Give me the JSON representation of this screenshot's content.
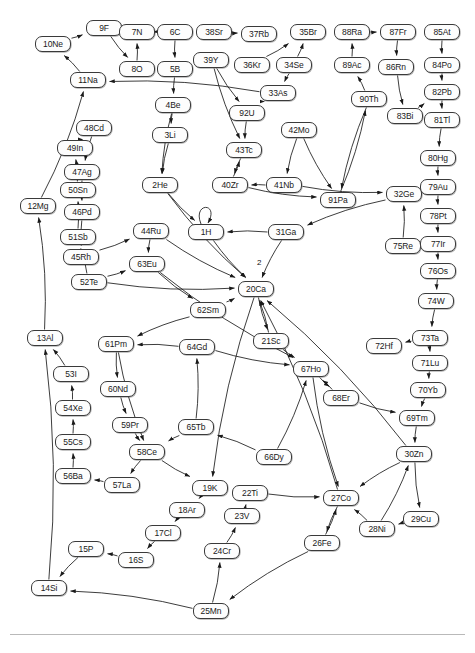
{
  "figure": {
    "type": "directed-graph",
    "node_shape": "rounded-rectangle",
    "node_width": 36,
    "node_height": 16,
    "colors": {
      "node_fill": "#fdfdfd",
      "node_border": "#3a3a3a",
      "edge": "#1a1a1a",
      "text": "#1a1a1a",
      "rule": "#b9b9b9",
      "background": "#ffffff"
    },
    "nodes": [
      {
        "id": "10Ne",
        "label": "10Ne",
        "x": 35,
        "y": 36
      },
      {
        "id": "9F",
        "label": "9F",
        "x": 86,
        "y": 20
      },
      {
        "id": "7N",
        "label": "7N",
        "x": 119,
        "y": 24
      },
      {
        "id": "6C",
        "label": "6C",
        "x": 157,
        "y": 24
      },
      {
        "id": "38Sr",
        "label": "38Sr",
        "x": 196,
        "y": 24
      },
      {
        "id": "37Rb",
        "label": "37Rb",
        "x": 241,
        "y": 26
      },
      {
        "id": "35Br",
        "label": "35Br",
        "x": 290,
        "y": 24
      },
      {
        "id": "88Ra",
        "label": "88Ra",
        "x": 334,
        "y": 24
      },
      {
        "id": "87Fr",
        "label": "87Fr",
        "x": 380,
        "y": 24
      },
      {
        "id": "85At",
        "label": "85At",
        "x": 424,
        "y": 24
      },
      {
        "id": "8O",
        "label": "8O",
        "x": 119,
        "y": 61
      },
      {
        "id": "5B",
        "label": "5B",
        "x": 157,
        "y": 61
      },
      {
        "id": "39Y",
        "label": "39Y",
        "x": 193,
        "y": 52
      },
      {
        "id": "36Kr",
        "label": "36Kr",
        "x": 234,
        "y": 57
      },
      {
        "id": "34Se",
        "label": "34Se",
        "x": 276,
        "y": 57
      },
      {
        "id": "89Ac",
        "label": "89Ac",
        "x": 334,
        "y": 57
      },
      {
        "id": "86Rn",
        "label": "86Rn",
        "x": 378,
        "y": 59
      },
      {
        "id": "84Po",
        "label": "84Po",
        "x": 424,
        "y": 57
      },
      {
        "id": "11Na",
        "label": "11Na",
        "x": 70,
        "y": 72
      },
      {
        "id": "33As",
        "label": "33As",
        "x": 260,
        "y": 85
      },
      {
        "id": "90Th",
        "label": "90Th",
        "x": 351,
        "y": 91
      },
      {
        "id": "82Pb",
        "label": "82Pb",
        "x": 424,
        "y": 84
      },
      {
        "id": "4Be",
        "label": "4Be",
        "x": 155,
        "y": 97
      },
      {
        "id": "92U",
        "label": "92U",
        "x": 229,
        "y": 105
      },
      {
        "id": "63Bi",
        "label": "83Bi",
        "x": 387,
        "y": 108
      },
      {
        "id": "81Tl",
        "label": "81Tl",
        "x": 424,
        "y": 112
      },
      {
        "id": "3Li",
        "label": "3Li",
        "x": 152,
        "y": 127
      },
      {
        "id": "42Mo",
        "label": "42Mo",
        "x": 281,
        "y": 122
      },
      {
        "id": "48Cd",
        "label": "48Cd",
        "x": 76,
        "y": 120
      },
      {
        "id": "43Tc",
        "label": "43Tc",
        "x": 226,
        "y": 142
      },
      {
        "id": "80Hg",
        "label": "80Hg",
        "x": 420,
        "y": 150
      },
      {
        "id": "49In",
        "label": "49In",
        "x": 57,
        "y": 140
      },
      {
        "id": "47Ag",
        "label": "47Ag",
        "x": 64,
        "y": 164
      },
      {
        "id": "50Sn",
        "label": "50Sn",
        "x": 60,
        "y": 182
      },
      {
        "id": "2He",
        "label": "2He",
        "x": 142,
        "y": 177
      },
      {
        "id": "40Zr",
        "label": "40Zr",
        "x": 212,
        "y": 177
      },
      {
        "id": "41Nb",
        "label": "41Nb",
        "x": 266,
        "y": 177
      },
      {
        "id": "91Pa",
        "label": "91Pa",
        "x": 320,
        "y": 192
      },
      {
        "id": "32Ge",
        "label": "32Ge",
        "x": 386,
        "y": 186
      },
      {
        "id": "79Au",
        "label": "79Au",
        "x": 420,
        "y": 179
      },
      {
        "id": "46Pd",
        "label": "46Pd",
        "x": 64,
        "y": 204
      },
      {
        "id": "78Pt",
        "label": "78Pt",
        "x": 420,
        "y": 208
      },
      {
        "id": "44Ru",
        "label": "44Ru",
        "x": 133,
        "y": 223
      },
      {
        "id": "1H",
        "label": "1H",
        "x": 188,
        "y": 224
      },
      {
        "id": "31Ga",
        "label": "31Ga",
        "x": 268,
        "y": 224
      },
      {
        "id": "51Sb",
        "label": "51Sb",
        "x": 60,
        "y": 229
      },
      {
        "id": "75Re",
        "label": "75Re",
        "x": 385,
        "y": 238
      },
      {
        "id": "77Ir",
        "label": "77Ir",
        "x": 420,
        "y": 236
      },
      {
        "id": "45Rh",
        "label": "45Rh",
        "x": 63,
        "y": 249
      },
      {
        "id": "63Eu",
        "label": "63Eu",
        "x": 129,
        "y": 256
      },
      {
        "id": "76Os",
        "label": "76Os",
        "x": 420,
        "y": 263
      },
      {
        "id": "52Te",
        "label": "52Te",
        "x": 71,
        "y": 274
      },
      {
        "id": "20Ca",
        "label": "20Ca",
        "x": 238,
        "y": 281
      },
      {
        "id": "74W",
        "label": "74W",
        "x": 418,
        "y": 293
      },
      {
        "id": "12Mg",
        "label": "12Mg",
        "x": 20,
        "y": 198
      },
      {
        "id": "62Sm",
        "label": "62Sm",
        "x": 190,
        "y": 302
      },
      {
        "id": "21Sc",
        "label": "21Sc",
        "x": 253,
        "y": 333
      },
      {
        "id": "72Hf",
        "label": "72Hf",
        "x": 366,
        "y": 338
      },
      {
        "id": "73Ta",
        "label": "73Ta",
        "x": 412,
        "y": 330
      },
      {
        "id": "13Al",
        "label": "13Al",
        "x": 27,
        "y": 330
      },
      {
        "id": "61Pm",
        "label": "61Pm",
        "x": 98,
        "y": 336
      },
      {
        "id": "64Gd",
        "label": "64Gd",
        "x": 179,
        "y": 339
      },
      {
        "id": "67Ho",
        "label": "67Ho",
        "x": 293,
        "y": 361
      },
      {
        "id": "71Lu",
        "label": "71Lu",
        "x": 412,
        "y": 355
      },
      {
        "id": "53I",
        "label": "53I",
        "x": 53,
        "y": 366
      },
      {
        "id": "60Nd",
        "label": "60Nd",
        "x": 100,
        "y": 381
      },
      {
        "id": "68Er",
        "label": "68Er",
        "x": 323,
        "y": 390
      },
      {
        "id": "70Yb",
        "label": "70Yb",
        "x": 410,
        "y": 382
      },
      {
        "id": "54Xe",
        "label": "54Xe",
        "x": 55,
        "y": 400
      },
      {
        "id": "59Pr",
        "label": "59Pr",
        "x": 112,
        "y": 417
      },
      {
        "id": "69Tm",
        "label": "69Tm",
        "x": 399,
        "y": 410
      },
      {
        "id": "65Tb",
        "label": "65Tb",
        "x": 178,
        "y": 419
      },
      {
        "id": "55Cs",
        "label": "55Cs",
        "x": 55,
        "y": 434
      },
      {
        "id": "58Ce",
        "label": "58Ce",
        "x": 129,
        "y": 444
      },
      {
        "id": "66Dy",
        "label": "66Dy",
        "x": 256,
        "y": 449
      },
      {
        "id": "30Zn",
        "label": "30Zn",
        "x": 396,
        "y": 446
      },
      {
        "id": "56Ba",
        "label": "56Ba",
        "x": 55,
        "y": 468
      },
      {
        "id": "57La",
        "label": "57La",
        "x": 104,
        "y": 477
      },
      {
        "id": "19K",
        "label": "19K",
        "x": 192,
        "y": 480
      },
      {
        "id": "22Ti",
        "label": "22Ti",
        "x": 232,
        "y": 485
      },
      {
        "id": "27Co",
        "label": "27Co",
        "x": 323,
        "y": 490
      },
      {
        "id": "29Cu",
        "label": "29Cu",
        "x": 403,
        "y": 511
      },
      {
        "id": "18Ar",
        "label": "18Ar",
        "x": 169,
        "y": 502
      },
      {
        "id": "23V",
        "label": "23V",
        "x": 224,
        "y": 508
      },
      {
        "id": "28Ni",
        "label": "28Ni",
        "x": 359,
        "y": 521
      },
      {
        "id": "17Cl",
        "label": "17Cl",
        "x": 145,
        "y": 525
      },
      {
        "id": "15P",
        "label": "15P",
        "x": 68,
        "y": 541
      },
      {
        "id": "16S",
        "label": "16S",
        "x": 118,
        "y": 552
      },
      {
        "id": "24Cr",
        "label": "24Cr",
        "x": 204,
        "y": 543
      },
      {
        "id": "26Fe",
        "label": "26Fe",
        "x": 304,
        "y": 535
      },
      {
        "id": "14Si",
        "label": "14Si",
        "x": 31,
        "y": 580
      },
      {
        "id": "25Mn",
        "label": "25Mn",
        "x": 193,
        "y": 603
      }
    ],
    "edges": [
      {
        "from": "10Ne",
        "to": "9F"
      },
      {
        "from": "9F",
        "to": "8O"
      },
      {
        "from": "7N",
        "to": "6C"
      },
      {
        "from": "8O",
        "to": "7N"
      },
      {
        "from": "6C",
        "to": "5B"
      },
      {
        "from": "5B",
        "to": "4Be"
      },
      {
        "from": "4Be",
        "to": "3Li"
      },
      {
        "from": "11Na",
        "to": "10Ne"
      },
      {
        "from": "38Sr",
        "to": "37Rb"
      },
      {
        "from": "36Kr",
        "to": "35Br"
      },
      {
        "from": "34Se",
        "to": "35Br"
      },
      {
        "from": "34Se",
        "to": "33As"
      },
      {
        "from": "33As",
        "to": "11Na"
      },
      {
        "from": "33As",
        "to": "92U"
      },
      {
        "from": "88Ra",
        "to": "87Fr"
      },
      {
        "from": "89Ac",
        "to": "88Ra"
      },
      {
        "from": "90Th",
        "to": "89Ac"
      },
      {
        "from": "87Fr",
        "to": "86Rn"
      },
      {
        "from": "85At",
        "to": "84Po"
      },
      {
        "from": "84Po",
        "to": "82Pb"
      },
      {
        "from": "86Rn",
        "to": "63Bi"
      },
      {
        "from": "63Bi",
        "to": "82Pb"
      },
      {
        "from": "82Pb",
        "to": "81Tl"
      },
      {
        "from": "81Tl",
        "to": "80Hg"
      },
      {
        "from": "80Hg",
        "to": "79Au"
      },
      {
        "from": "79Au",
        "to": "78Pt"
      },
      {
        "from": "78Pt",
        "to": "77Ir"
      },
      {
        "from": "77Ir",
        "to": "76Os"
      },
      {
        "from": "76Os",
        "to": "74W"
      },
      {
        "from": "74W",
        "to": "73Ta"
      },
      {
        "from": "73Ta",
        "to": "72Hf"
      },
      {
        "from": "73Ta",
        "to": "71Lu"
      },
      {
        "from": "71Lu",
        "to": "70Yb"
      },
      {
        "from": "70Yb",
        "to": "69Tm"
      },
      {
        "from": "69Tm",
        "to": "30Zn"
      },
      {
        "from": "48Cd",
        "to": "47Ag"
      },
      {
        "from": "49In",
        "to": "48Cd"
      },
      {
        "from": "47Ag",
        "to": "46Pd"
      },
      {
        "from": "50Sn",
        "to": "49In"
      },
      {
        "from": "46Pd",
        "to": "45Rh"
      },
      {
        "from": "51Sb",
        "to": "50Sn"
      },
      {
        "from": "45Rh",
        "to": "44Ru"
      },
      {
        "from": "52Te",
        "to": "51Sb"
      },
      {
        "from": "52Te",
        "to": "63Eu"
      },
      {
        "from": "44Ru",
        "to": "63Eu"
      },
      {
        "from": "41Nb",
        "to": "40Zr"
      },
      {
        "from": "42Mo",
        "to": "41Nb"
      },
      {
        "from": "40Zr",
        "to": "43Tc"
      },
      {
        "from": "2He",
        "to": "1H"
      },
      {
        "from": "1H",
        "to": "1H",
        "self": true
      },
      {
        "from": "31Ga",
        "to": "1H"
      },
      {
        "from": "31Ga",
        "to": "20Ca",
        "label": "2"
      },
      {
        "from": "75Re",
        "to": "32Ge"
      },
      {
        "from": "52Te",
        "to": "20Ca"
      },
      {
        "from": "62Sm",
        "to": "61Pm"
      },
      {
        "from": "60Nd",
        "to": "59Pr"
      },
      {
        "from": "59Pr",
        "to": "58Ce"
      },
      {
        "from": "61Pm",
        "to": "60Nd"
      },
      {
        "from": "53I",
        "to": "13Al"
      },
      {
        "from": "54Xe",
        "to": "53I"
      },
      {
        "from": "55Cs",
        "to": "54Xe"
      },
      {
        "from": "56Ba",
        "to": "55Cs"
      },
      {
        "from": "57La",
        "to": "56Ba"
      },
      {
        "from": "58Ce",
        "to": "57La"
      },
      {
        "from": "19K",
        "to": "18Ar"
      },
      {
        "from": "18Ar",
        "to": "17Cl"
      },
      {
        "from": "17Cl",
        "to": "16S"
      },
      {
        "from": "16S",
        "to": "15P"
      },
      {
        "from": "15P",
        "to": "14Si"
      },
      {
        "from": "25Mn",
        "to": "24Cr"
      },
      {
        "from": "24Cr",
        "to": "23V"
      },
      {
        "from": "23V",
        "to": "22Ti"
      },
      {
        "from": "25Mn",
        "to": "14Si"
      },
      {
        "from": "27Co",
        "to": "26Fe"
      },
      {
        "from": "28Ni",
        "to": "27Co"
      },
      {
        "from": "28Ni",
        "to": "30Zn"
      },
      {
        "from": "30Zn",
        "to": "29Cu"
      },
      {
        "from": "29Cu",
        "to": "28Ni"
      },
      {
        "from": "22Ti",
        "to": "27Co"
      },
      {
        "from": "26Fe",
        "to": "25Mn"
      },
      {
        "from": "13Al",
        "to": "12Mg"
      },
      {
        "from": "12Mg",
        "to": "11Na"
      },
      {
        "from": "14Si",
        "to": "13Al"
      },
      {
        "from": "67Ho",
        "to": "68Er"
      },
      {
        "from": "68Er",
        "to": "69Tm"
      },
      {
        "from": "64Gd",
        "to": "67Ho"
      },
      {
        "from": "21Sc",
        "to": "67Ho"
      },
      {
        "from": "65Tb",
        "to": "64Gd"
      },
      {
        "from": "66Dy",
        "to": "65Tb"
      },
      {
        "from": "20Ca",
        "to": "21Sc"
      },
      {
        "from": "63Eu",
        "to": "62Sm"
      },
      {
        "from": "92U",
        "to": "43Tc"
      },
      {
        "from": "43Tc",
        "to": "40Zr"
      },
      {
        "from": "39Y",
        "to": "92U"
      },
      {
        "from": "91Pa",
        "to": "90Th"
      },
      {
        "from": "32Ge",
        "to": "31Ga"
      },
      {
        "from": "42Mo",
        "to": "91Pa"
      },
      {
        "from": "20Ca",
        "to": "19K"
      },
      {
        "from": "58Ce",
        "to": "19K"
      },
      {
        "from": "61Pm",
        "to": "58Ce"
      },
      {
        "from": "67Ho",
        "to": "27Co"
      },
      {
        "from": "1H",
        "to": "20Ca"
      },
      {
        "from": "2He",
        "to": "20Ca"
      },
      {
        "from": "62Sm",
        "to": "20Ca"
      },
      {
        "from": "44Ru",
        "to": "20Ca"
      },
      {
        "from": "21Sc",
        "to": "20Ca"
      },
      {
        "from": "30Zn",
        "to": "20Ca"
      },
      {
        "from": "27Co",
        "to": "20Ca"
      },
      {
        "from": "3Li",
        "to": "2He"
      },
      {
        "from": "4Be",
        "to": "2He"
      },
      {
        "from": "39Y",
        "to": "43Tc"
      },
      {
        "from": "90Th",
        "to": "91Pa"
      },
      {
        "from": "40Zr",
        "to": "91Pa"
      },
      {
        "from": "41Nb",
        "to": "32Ge"
      },
      {
        "from": "63Eu",
        "to": "67Ho"
      },
      {
        "from": "66Dy",
        "to": "67Ho"
      },
      {
        "from": "68Er",
        "to": "67Ho"
      },
      {
        "from": "64Gd",
        "to": "61Pm"
      },
      {
        "from": "65Tb",
        "to": "58Ce"
      },
      {
        "from": "30Zn",
        "to": "27Co"
      },
      {
        "from": "26Fe",
        "to": "27Co"
      }
    ],
    "edge_labels": [
      {
        "text": "2",
        "x": 257,
        "y": 259
      }
    ]
  }
}
